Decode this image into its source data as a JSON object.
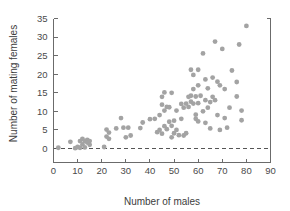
{
  "chart_data": {
    "type": "scatter",
    "title": "",
    "xlabel": "Number of males",
    "ylabel": "Number of mating females",
    "xlim": [
      0,
      90
    ],
    "ylim": [
      0,
      35
    ],
    "xticks": [
      0,
      10,
      20,
      30,
      40,
      50,
      60,
      70,
      80,
      90
    ],
    "yticks": [
      0,
      5,
      10,
      15,
      20,
      25,
      30,
      35
    ],
    "grid": false,
    "legend": null,
    "marker_color": "#a3a3a3",
    "axis_color": "#6b6b6b",
    "reference_lines": [
      {
        "orientation": "horizontal",
        "value": 0,
        "style": "dashed",
        "color": "#555555"
      }
    ],
    "points": [
      [
        2,
        0.2
      ],
      [
        7,
        1.8
      ],
      [
        9,
        0.1
      ],
      [
        10,
        0.4
      ],
      [
        11,
        0.2
      ],
      [
        11,
        2.0
      ],
      [
        12,
        1.1
      ],
      [
        12,
        2.6
      ],
      [
        13,
        2.0
      ],
      [
        13,
        0.3
      ],
      [
        14,
        2.3
      ],
      [
        14,
        1.6
      ],
      [
        15,
        2.0
      ],
      [
        15,
        1.0
      ],
      [
        21,
        0.4
      ],
      [
        22,
        5.1
      ],
      [
        22,
        3.2
      ],
      [
        23,
        2.6
      ],
      [
        23,
        4.3
      ],
      [
        26,
        5.4
      ],
      [
        28,
        8.2
      ],
      [
        29,
        5.6
      ],
      [
        30,
        3.0
      ],
      [
        31,
        5.6
      ],
      [
        32,
        3.5
      ],
      [
        36,
        5.5
      ],
      [
        37,
        7.0
      ],
      [
        40,
        7.9
      ],
      [
        42,
        8.0
      ],
      [
        43,
        4.4
      ],
      [
        44,
        5.0
      ],
      [
        44,
        9.0
      ],
      [
        45,
        13.9
      ],
      [
        45,
        11.8
      ],
      [
        45,
        4.0
      ],
      [
        46,
        6.0
      ],
      [
        46,
        15.1
      ],
      [
        46,
        10.2
      ],
      [
        47,
        11.2
      ],
      [
        47,
        5.2
      ],
      [
        48,
        7.2
      ],
      [
        48,
        11.1
      ],
      [
        49,
        15.0
      ],
      [
        49,
        6.1
      ],
      [
        49,
        3.0
      ],
      [
        50,
        7.5
      ],
      [
        50,
        4.1
      ],
      [
        51,
        5.0
      ],
      [
        51,
        10.2
      ],
      [
        52,
        3.6
      ],
      [
        53,
        12.0
      ],
      [
        53,
        8.0
      ],
      [
        54,
        3.5
      ],
      [
        54,
        11.0
      ],
      [
        55,
        4.1
      ],
      [
        55,
        12.1
      ],
      [
        56,
        13.9
      ],
      [
        56,
        11.2
      ],
      [
        57,
        14.2
      ],
      [
        57,
        21.2
      ],
      [
        57,
        12.6
      ],
      [
        58,
        19.8
      ],
      [
        58,
        12.1
      ],
      [
        58,
        16.0
      ],
      [
        59,
        14.0
      ],
      [
        59,
        8.0
      ],
      [
        59,
        9.1
      ],
      [
        60,
        21.2
      ],
      [
        60,
        17.0
      ],
      [
        60,
        12.2
      ],
      [
        60,
        7.3
      ],
      [
        61,
        14.2
      ],
      [
        62,
        10.0
      ],
      [
        62,
        25.6
      ],
      [
        63,
        18.6
      ],
      [
        63,
        13.0
      ],
      [
        63,
        6.9
      ],
      [
        64,
        11.0
      ],
      [
        64,
        16.2
      ],
      [
        65,
        5.4
      ],
      [
        65,
        12.5
      ],
      [
        66,
        19.1
      ],
      [
        66,
        13.9
      ],
      [
        67,
        28.8
      ],
      [
        67,
        13.0
      ],
      [
        68,
        18.0
      ],
      [
        68,
        9.0
      ],
      [
        69,
        5.0
      ],
      [
        69,
        17.0
      ],
      [
        70,
        26.8
      ],
      [
        71,
        8.2
      ],
      [
        71,
        16.0
      ],
      [
        72,
        5.6
      ],
      [
        73,
        11.0
      ],
      [
        74,
        21.0
      ],
      [
        76,
        14.0
      ],
      [
        76,
        17.9
      ],
      [
        77,
        28.0
      ],
      [
        78,
        10.2
      ],
      [
        78,
        7.6
      ],
      [
        80,
        33.0
      ]
    ]
  }
}
